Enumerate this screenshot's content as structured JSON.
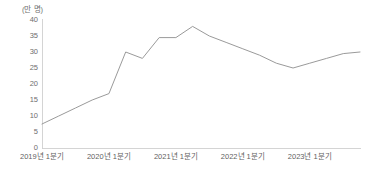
{
  "chart_data": {
    "type": "line",
    "title": "",
    "subtitle": "",
    "xlabel": "",
    "ylabel": "",
    "unit_label": "(만 명)",
    "ylim": [
      0,
      40
    ],
    "yticks": [
      0,
      5,
      10,
      15,
      20,
      25,
      30,
      35,
      40
    ],
    "ytick_labels": [
      "0",
      "5",
      "10",
      "15",
      "20",
      "25",
      "30",
      "35",
      "40"
    ],
    "grid": false,
    "legend": "none",
    "xtick_labels": [
      "2019년 1분기",
      "2020년 1분기",
      "2021년 1분기",
      "2022년 1분기",
      "2023년 1분기"
    ],
    "x": [
      "2019 1분기",
      "2019 2분기",
      "2019 3분기",
      "2019 4분기",
      "2020 1분기",
      "2020 2분기",
      "2020 3분기",
      "2020 4분기",
      "2021 1분기",
      "2021 2분기",
      "2021 3분기",
      "2021 4분기",
      "2022 1분기",
      "2022 2분기",
      "2022 3분기",
      "2022 4분기",
      "2023 1분기",
      "2023 2분기",
      "2023 3분기",
      "2023 4분기"
    ],
    "values": [
      7.5,
      10,
      12.5,
      15,
      17,
      30,
      28,
      34.5,
      34.5,
      38,
      35,
      33,
      31,
      29,
      26.5,
      25,
      26.5,
      28,
      29.5,
      30
    ],
    "series": [
      {
        "name": "인원",
        "color": "#9a9a9a",
        "values": [
          7.5,
          10,
          12.5,
          15,
          17,
          30,
          28,
          34.5,
          34.5,
          38,
          35,
          33,
          31,
          29,
          26.5,
          25,
          26.5,
          28,
          29.5,
          30
        ]
      }
    ],
    "axis_color": "#c9c9c9",
    "label_color": "#6e6e6e"
  },
  "layout": {
    "plot_left": 42,
    "plot_right": 360,
    "plot_top": 20,
    "plot_bottom": 148,
    "x_year_spacing": 63
  }
}
